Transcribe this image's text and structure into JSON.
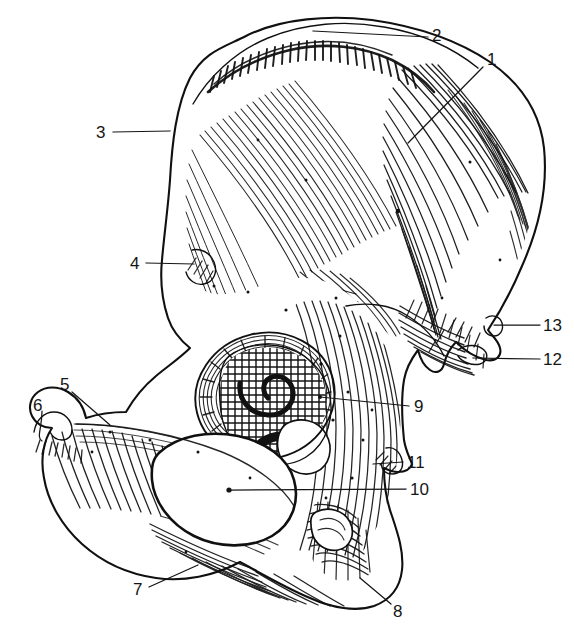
{
  "figure": {
    "kind": "anatomical-line-drawing",
    "background_color": "#ffffff",
    "ink_color": "#101010",
    "width": 574,
    "height": 641
  },
  "labels": [
    {
      "id": "1",
      "text": "1",
      "x": 487,
      "y": 51,
      "leader": {
        "x1": 483,
        "y1": 67,
        "x2": 408,
        "y2": 143
      }
    },
    {
      "id": "2",
      "text": "2",
      "x": 432,
      "y": 27,
      "leader": {
        "x1": 428,
        "y1": 37,
        "x2": 313,
        "y2": 31
      }
    },
    {
      "id": "3",
      "text": "3",
      "x": 96,
      "y": 124,
      "leader": {
        "x1": 113,
        "y1": 132,
        "x2": 170,
        "y2": 131
      }
    },
    {
      "id": "4",
      "text": "4",
      "x": 130,
      "y": 255,
      "leader": {
        "x1": 146,
        "y1": 263,
        "x2": 194,
        "y2": 264
      }
    },
    {
      "id": "5",
      "text": "5",
      "x": 60,
      "y": 376,
      "leader": {
        "x1": 72,
        "y1": 392,
        "x2": 110,
        "y2": 425
      }
    },
    {
      "id": "6",
      "text": "6",
      "x": 33,
      "y": 397,
      "leader": {
        "x1": 42,
        "y1": 411,
        "x2": 42,
        "y2": 441
      }
    },
    {
      "id": "7",
      "text": "7",
      "x": 133,
      "y": 581,
      "leader": {
        "x1": 149,
        "y1": 587,
        "x2": 198,
        "y2": 565
      }
    },
    {
      "id": "8",
      "text": "8",
      "x": 393,
      "y": 603,
      "leader": {
        "x1": 391,
        "y1": 604,
        "x2": 360,
        "y2": 578
      }
    },
    {
      "id": "9",
      "text": "9",
      "x": 414,
      "y": 398,
      "leader": {
        "x1": 409,
        "y1": 406,
        "x2": 320,
        "y2": 397
      }
    },
    {
      "id": "10",
      "text": "10",
      "x": 410,
      "y": 481,
      "leader": {
        "x1": 406,
        "y1": 489,
        "x2": 229,
        "y2": 490
      }
    },
    {
      "id": "11",
      "text": "11",
      "x": 407,
      "y": 454,
      "leader": {
        "x1": 403,
        "y1": 462,
        "x2": 373,
        "y2": 464
      }
    },
    {
      "id": "12",
      "text": "12",
      "x": 543,
      "y": 351,
      "leader": {
        "x1": 540,
        "y1": 359,
        "x2": 473,
        "y2": 358
      }
    },
    {
      "id": "13",
      "text": "13",
      "x": 543,
      "y": 317,
      "leader": {
        "x1": 540,
        "y1": 325,
        "x2": 494,
        "y2": 325
      }
    }
  ],
  "regions": [
    {
      "name": "ilium-wing"
    },
    {
      "name": "iliac-crest"
    },
    {
      "name": "anterior-superior-iliac-spine"
    },
    {
      "name": "anterior-inferior-iliac-spine"
    },
    {
      "name": "superior-pubic-ramus"
    },
    {
      "name": "pubic-tubercle"
    },
    {
      "name": "inferior-pubic-ramus"
    },
    {
      "name": "ischial-tuberosity"
    },
    {
      "name": "acetabulum"
    },
    {
      "name": "obturator-foramen"
    },
    {
      "name": "ischial-spine"
    },
    {
      "name": "greater-sciatic-notch"
    },
    {
      "name": "posterior-inferior-iliac-spine"
    }
  ]
}
